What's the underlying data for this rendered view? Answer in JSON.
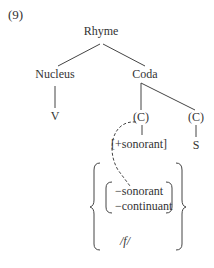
{
  "example_number": "(9)",
  "tree": {
    "root": "Rhyme",
    "nucleus": "Nucleus",
    "coda": "Coda",
    "vowel": "V",
    "c1": "(C)",
    "c2": "(C)",
    "c1_feature": "[+sonorant]",
    "c2_segment": "S"
  },
  "constraint": {
    "feature1": "−sonorant",
    "feature2": "−continuant",
    "segment": "/f/"
  }
}
